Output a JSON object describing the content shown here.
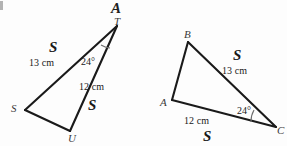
{
  "figure": {
    "background_color": "#fdfdfd",
    "stroke_color": "#1a1a1a",
    "degree_symbol": "°"
  },
  "triangle_left": {
    "name": "triangle-TSU",
    "vertices": [
      {
        "label": "A",
        "x": 117,
        "y": 10,
        "style": "large"
      },
      {
        "label": "T",
        "x": 117,
        "y": 26,
        "style": "small"
      },
      {
        "label": "S",
        "x": 25,
        "y": 110,
        "style": "small"
      },
      {
        "label": "U",
        "x": 70,
        "y": 131,
        "style": "small"
      }
    ],
    "side_labels": [
      {
        "text": "13 cm",
        "side": "T-S"
      },
      {
        "text": "12 cm",
        "side": "T-U"
      }
    ],
    "congruence_marks": [
      {
        "text": "S",
        "side": "T-S"
      },
      {
        "text": "S",
        "side": "T-U"
      }
    ],
    "angle": {
      "text": "24",
      "unit": "°",
      "at_vertex": "T"
    }
  },
  "triangle_right": {
    "name": "triangle-BAC",
    "vertices": [
      {
        "label": "B",
        "x": 188,
        "y": 42,
        "style": "small"
      },
      {
        "label": "A",
        "x": 172,
        "y": 100,
        "style": "small"
      },
      {
        "label": "C",
        "x": 276,
        "y": 127,
        "style": "small"
      }
    ],
    "side_labels": [
      {
        "text": "13 cm",
        "side": "B-C"
      },
      {
        "text": "12 cm",
        "side": "A-C"
      }
    ],
    "congruence_marks": [
      {
        "text": "S",
        "side": "B-C"
      },
      {
        "text": "S",
        "side": "A-C"
      }
    ],
    "angle": {
      "text": "24",
      "unit": "°",
      "at_vertex": "C"
    }
  },
  "labels": {
    "left_vertex_A": "A",
    "left_vertex_T": "T",
    "left_vertex_S": "S",
    "left_vertex_U": "U",
    "left_side_13": "13 cm",
    "left_side_12": "12 cm",
    "left_mark_upper": "S",
    "left_mark_lower": "S",
    "left_angle": "24°",
    "right_vertex_B": "B",
    "right_vertex_A": "A",
    "right_vertex_C": "C",
    "right_side_13": "13 cm",
    "right_side_12": "12 cm",
    "right_mark_upper": "S",
    "right_mark_lower": "S",
    "right_angle": "24°"
  }
}
